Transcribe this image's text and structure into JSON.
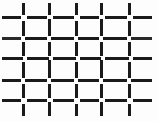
{
  "image": {
    "title": "Woven wire mesh pattern",
    "description": "Orthogonal basket-weave grid of short dark bar segments on a white ground",
    "width": 158,
    "height": 121,
    "background_color": "#fdfdfd",
    "line_color": "#1a1a1a",
    "line_color_secondary": "#3c3c3c",
    "stroke_width": 3,
    "pattern_type": "woven-grid"
  },
  "grid": {
    "horizontal_line_positions": [
      17,
      38,
      58,
      80,
      100
    ],
    "vertical_line_positions": [
      23,
      49,
      76,
      101,
      129
    ],
    "cell_width": 26,
    "cell_height": 21,
    "gap_size": 4,
    "columns": 5,
    "rows": 5
  },
  "segments": {
    "horizontal": [
      {
        "y": 17,
        "x1": 2,
        "x2": 21,
        "shade": "#1a1a1a"
      },
      {
        "y": 17,
        "x1": 27,
        "x2": 47,
        "shade": "#1a1a1a"
      },
      {
        "y": 17,
        "x1": 53,
        "x2": 74,
        "shade": "#1a1a1a"
      },
      {
        "y": 17,
        "x1": 80,
        "x2": 99,
        "shade": "#1a1a1a"
      },
      {
        "y": 17,
        "x1": 105,
        "x2": 127,
        "shade": "#1a1a1a"
      },
      {
        "y": 17,
        "x1": 133,
        "x2": 152,
        "shade": "#1a1a1a"
      },
      {
        "y": 38,
        "x1": 2,
        "x2": 21,
        "shade": "#2a2a2a"
      },
      {
        "y": 38,
        "x1": 25,
        "x2": 47,
        "shade": "#1a1a1a"
      },
      {
        "y": 38,
        "x1": 51,
        "x2": 74,
        "shade": "#1a1a1a"
      },
      {
        "y": 38,
        "x1": 78,
        "x2": 99,
        "shade": "#1a1a1a"
      },
      {
        "y": 38,
        "x1": 103,
        "x2": 127,
        "shade": "#1a1a1a"
      },
      {
        "y": 38,
        "x1": 131,
        "x2": 152,
        "shade": "#2a2a2a"
      },
      {
        "y": 58,
        "x1": 2,
        "x2": 23,
        "shade": "#1a1a1a"
      },
      {
        "y": 58,
        "x1": 27,
        "x2": 49,
        "shade": "#1a1a1a"
      },
      {
        "y": 58,
        "x1": 53,
        "x2": 76,
        "shade": "#1a1a1a"
      },
      {
        "y": 58,
        "x1": 80,
        "x2": 101,
        "shade": "#1a1a1a"
      },
      {
        "y": 58,
        "x1": 105,
        "x2": 129,
        "shade": "#1a1a1a"
      },
      {
        "y": 58,
        "x1": 133,
        "x2": 152,
        "shade": "#1a1a1a"
      },
      {
        "y": 80,
        "x1": 2,
        "x2": 21,
        "shade": "#1a1a1a"
      },
      {
        "y": 80,
        "x1": 25,
        "x2": 47,
        "shade": "#1a1a1a"
      },
      {
        "y": 80,
        "x1": 51,
        "x2": 74,
        "shade": "#1a1a1a"
      },
      {
        "y": 80,
        "x1": 78,
        "x2": 99,
        "shade": "#1a1a1a"
      },
      {
        "y": 80,
        "x1": 103,
        "x2": 127,
        "shade": "#1a1a1a"
      },
      {
        "y": 80,
        "x1": 131,
        "x2": 152,
        "shade": "#1a1a1a"
      },
      {
        "y": 100,
        "x1": 2,
        "x2": 21,
        "shade": "#1a1a1a"
      },
      {
        "y": 100,
        "x1": 27,
        "x2": 47,
        "shade": "#1a1a1a"
      },
      {
        "y": 100,
        "x1": 53,
        "x2": 74,
        "shade": "#1a1a1a"
      },
      {
        "y": 100,
        "x1": 80,
        "x2": 99,
        "shade": "#1a1a1a"
      },
      {
        "y": 100,
        "x1": 105,
        "x2": 127,
        "shade": "#1a1a1a"
      },
      {
        "y": 100,
        "x1": 133,
        "x2": 152,
        "shade": "#1a1a1a"
      }
    ],
    "vertical": [
      {
        "x": 23,
        "y1": 3,
        "y2": 15,
        "shade": "#1a1a1a"
      },
      {
        "x": 23,
        "y1": 21,
        "y2": 36,
        "shade": "#1a1a1a"
      },
      {
        "x": 23,
        "y1": 42,
        "y2": 56,
        "shade": "#1a1a1a"
      },
      {
        "x": 23,
        "y1": 62,
        "y2": 78,
        "shade": "#1a1a1a"
      },
      {
        "x": 23,
        "y1": 84,
        "y2": 98,
        "shade": "#1a1a1a"
      },
      {
        "x": 23,
        "y1": 104,
        "y2": 116,
        "shade": "#1a1a1a"
      },
      {
        "x": 49,
        "y1": 3,
        "y2": 15,
        "shade": "#1a1a1a"
      },
      {
        "x": 49,
        "y1": 19,
        "y2": 36,
        "shade": "#1a1a1a"
      },
      {
        "x": 49,
        "y1": 42,
        "y2": 56,
        "shade": "#1a1a1a"
      },
      {
        "x": 49,
        "y1": 60,
        "y2": 78,
        "shade": "#1a1a1a"
      },
      {
        "x": 49,
        "y1": 84,
        "y2": 98,
        "shade": "#1a1a1a"
      },
      {
        "x": 49,
        "y1": 102,
        "y2": 116,
        "shade": "#1a1a1a"
      },
      {
        "x": 76,
        "y1": 3,
        "y2": 15,
        "shade": "#1a1a1a"
      },
      {
        "x": 76,
        "y1": 21,
        "y2": 36,
        "shade": "#1a1a1a"
      },
      {
        "x": 76,
        "y1": 42,
        "y2": 56,
        "shade": "#1a1a1a"
      },
      {
        "x": 76,
        "y1": 62,
        "y2": 78,
        "shade": "#1a1a1a"
      },
      {
        "x": 76,
        "y1": 84,
        "y2": 98,
        "shade": "#1a1a1a"
      },
      {
        "x": 76,
        "y1": 104,
        "y2": 116,
        "shade": "#1a1a1a"
      },
      {
        "x": 101,
        "y1": 3,
        "y2": 15,
        "shade": "#1a1a1a"
      },
      {
        "x": 101,
        "y1": 19,
        "y2": 36,
        "shade": "#1a1a1a"
      },
      {
        "x": 101,
        "y1": 42,
        "y2": 56,
        "shade": "#1a1a1a"
      },
      {
        "x": 101,
        "y1": 60,
        "y2": 78,
        "shade": "#1a1a1a"
      },
      {
        "x": 101,
        "y1": 84,
        "y2": 98,
        "shade": "#1a1a1a"
      },
      {
        "x": 101,
        "y1": 102,
        "y2": 116,
        "shade": "#1a1a1a"
      },
      {
        "x": 129,
        "y1": 3,
        "y2": 15,
        "shade": "#1a1a1a"
      },
      {
        "x": 129,
        "y1": 21,
        "y2": 36,
        "shade": "#1a1a1a"
      },
      {
        "x": 129,
        "y1": 42,
        "y2": 56,
        "shade": "#1a1a1a"
      },
      {
        "x": 129,
        "y1": 62,
        "y2": 78,
        "shade": "#1a1a1a"
      },
      {
        "x": 129,
        "y1": 84,
        "y2": 98,
        "shade": "#1a1a1a"
      },
      {
        "x": 129,
        "y1": 104,
        "y2": 116,
        "shade": "#1a1a1a"
      }
    ]
  }
}
